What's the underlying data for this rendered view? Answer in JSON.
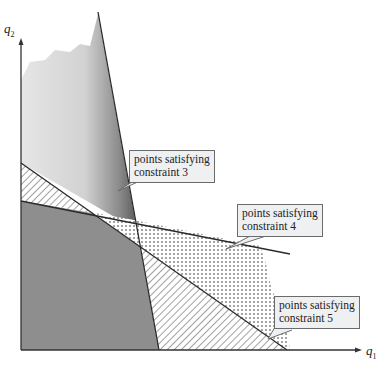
{
  "diagram": {
    "axes": {
      "x_label": "q",
      "x_sub": "1",
      "y_label": "q",
      "y_sub": "2"
    },
    "callouts": [
      {
        "id": "constraint-3",
        "line1": "points satisfying",
        "line2": "constraint 3"
      },
      {
        "id": "constraint-4",
        "line1": "points satisfying",
        "line2": "constraint 4"
      },
      {
        "id": "constraint-5",
        "line1": "points satisfying",
        "line2": "constraint 5"
      }
    ],
    "regions": [
      {
        "name": "constraint-3-region",
        "fill": "gradient-gray"
      },
      {
        "name": "constraint-4-region",
        "fill": "dotted"
      },
      {
        "name": "constraint-5-region",
        "fill": "hatched"
      },
      {
        "name": "feasible-region",
        "fill": "#8e8e8e"
      }
    ],
    "colors": {
      "feasible": "#8e8e8e",
      "line": "#2a2a2a",
      "callout_bg": "#eef0f2"
    }
  }
}
